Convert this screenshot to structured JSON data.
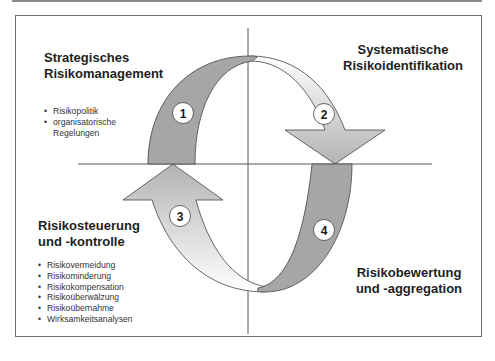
{
  "diagram": {
    "type": "risk-management-cycle",
    "colors": {
      "dark_band": "#a6a6a6",
      "light_gradient_start": "#ffffff",
      "light_gradient_end": "#b9b9b9",
      "axis_line": "#555555",
      "frame_border": "#6e6e6e",
      "badge_fill": "#ffffff"
    },
    "quadrants": {
      "top_left": {
        "step": "1",
        "title_lines": [
          "Strategisches",
          "Risikomanagement"
        ],
        "bullets": [
          "Risikopolitik",
          "organisatorische",
          "Regelungen"
        ]
      },
      "top_right": {
        "step": "2",
        "title_lines": [
          "Systematische",
          "Risikoidentifikation"
        ]
      },
      "bottom_right": {
        "step": "4",
        "title_lines": [
          "Risikobewertung",
          "und -aggregation"
        ]
      },
      "bottom_left": {
        "step": "3",
        "title_lines": [
          "Risikosteuerung",
          "und -kontrolle"
        ],
        "bullets": [
          "Risikovermeidung",
          "Risikominderung",
          "Risikokompensation",
          "Risikoüberwälzung",
          "Risikoübernahme",
          "Wirksamkeitsanalysen"
        ]
      }
    }
  }
}
